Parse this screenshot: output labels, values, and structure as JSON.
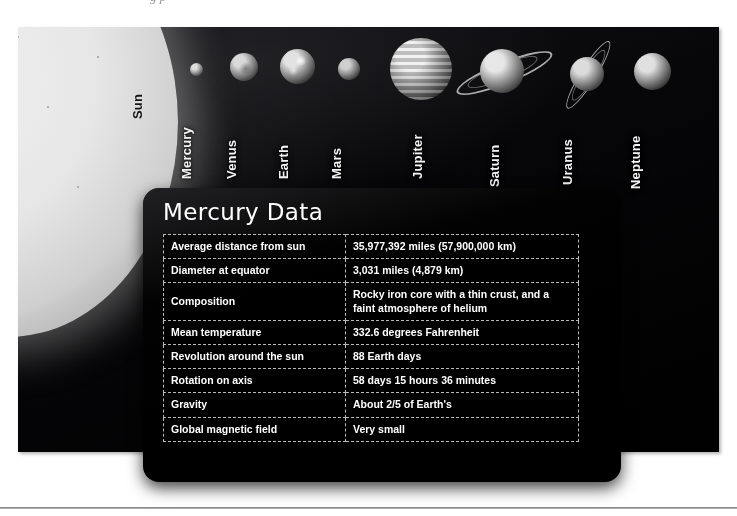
{
  "figure": {
    "clipped_caption_artifact": "g        p",
    "sun_label": "Sun",
    "planets": [
      {
        "name": "Mercury",
        "left": 172,
        "top": 36,
        "size": 13,
        "shade_light": "#dedede",
        "shade_dark": "#4a4a4a",
        "label_x": 161,
        "label_y": 152,
        "ring": false
      },
      {
        "name": "Venus",
        "left": 212,
        "top": 26,
        "size": 28,
        "shade_light": "#d9d9d9",
        "shade_dark": "#3d3d3d",
        "label_x": 206,
        "label_y": 152,
        "ring": false
      },
      {
        "name": "Earth",
        "left": 262,
        "top": 22,
        "size": 35,
        "shade_light": "#e2e2e2",
        "shade_dark": "#343434",
        "label_x": 258,
        "label_y": 152,
        "ring": false
      },
      {
        "name": "Mars",
        "left": 320,
        "top": 31,
        "size": 22,
        "shade_light": "#cfcfcf",
        "shade_dark": "#3a3a3a",
        "label_x": 311,
        "label_y": 152,
        "ring": false
      },
      {
        "name": "Jupiter",
        "left": 372,
        "top": 11,
        "size": 62,
        "shade_light": "#ededed",
        "shade_dark": "#3c3c3c",
        "label_x": 392,
        "label_y": 152,
        "ring": false
      },
      {
        "name": "Saturn",
        "left": 462,
        "top": 22,
        "size": 44,
        "shade_light": "#e7e7e7",
        "shade_dark": "#3b3b3b",
        "label_x": 469,
        "label_y": 160,
        "ring": true
      },
      {
        "name": "Uranus",
        "left": 552,
        "top": 30,
        "size": 34,
        "shade_light": "#dcdcdc",
        "shade_dark": "#3a3a3a",
        "label_x": 542,
        "label_y": 158,
        "ring": true
      },
      {
        "name": "Neptune",
        "left": 616,
        "top": 26,
        "size": 37,
        "shade_light": "#e0e0e0",
        "shade_dark": "#323232",
        "label_x": 610,
        "label_y": 162,
        "ring": false
      }
    ]
  },
  "panel": {
    "title": "Mercury Data",
    "rows": [
      {
        "label": "Average distance from sun",
        "value": "35,977,392 miles (57,900,000 km)"
      },
      {
        "label": "Diameter at equator",
        "value": "3,031 miles (4,879 km)"
      },
      {
        "label": "Composition",
        "value": "Rocky iron core with a thin crust, and a faint atmosphere of helium"
      },
      {
        "label": "Mean temperature",
        "value": "332.6 degrees Fahrenheit"
      },
      {
        "label": "Revolution around the sun",
        "value": "88 Earth days"
      },
      {
        "label": "Rotation on axis",
        "value": "58 days 15 hours 36 minutes"
      },
      {
        "label": "Gravity",
        "value": "About 2/5 of Earth's"
      },
      {
        "label": "Global magnetic field",
        "value": "Very small"
      }
    ]
  },
  "colors": {
    "panel_background": "#000000",
    "table_border": "#b9b9b9",
    "text": "#ffffff",
    "page_background": "#ffffff",
    "rule": "#8e8e8e"
  }
}
